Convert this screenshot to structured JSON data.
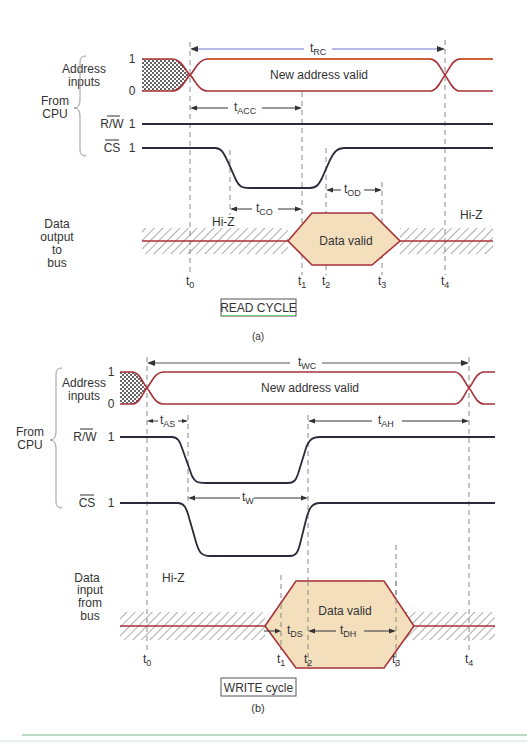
{
  "colors": {
    "signal_red": "#a8323a",
    "signal_orange": "#d0602a",
    "signal_dark": "#2a2a3a",
    "arrow_blue": "#6a6ad0",
    "data_fill": "#f3dfbc",
    "hatch": "#777777",
    "dashed": "#888888",
    "green_rule": "#7fb890"
  },
  "read_cycle": {
    "group_label_line1": "From",
    "group_label_line2": "CPU",
    "signals": {
      "address_line1": "Address",
      "address_line2": "inputs",
      "address_high": "1",
      "address_low": "0",
      "address_valid_text": "New address valid",
      "rw_label": "R/W",
      "rw_level": "1",
      "cs_label": "CS",
      "cs_level": "1",
      "data_line1": "Data",
      "data_line2": "output",
      "data_line3": "to",
      "data_line4": "bus",
      "data_valid_text": "Data valid",
      "hiz_left": "Hi-Z",
      "hiz_right": "Hi-Z"
    },
    "timing_params": {
      "t_RC": {
        "base": "t",
        "sub": "RC"
      },
      "t_ACC": {
        "base": "t",
        "sub": "ACC"
      },
      "t_CO": {
        "base": "t",
        "sub": "CO"
      },
      "t_OD": {
        "base": "t",
        "sub": "OD"
      }
    },
    "time_markers": [
      {
        "base": "t",
        "sub": "0"
      },
      {
        "base": "t",
        "sub": "1"
      },
      {
        "base": "t",
        "sub": "2"
      },
      {
        "base": "t",
        "sub": "3"
      },
      {
        "base": "t",
        "sub": "4"
      }
    ],
    "caption_box": "READ CYCLE",
    "sub_caption": "(a)"
  },
  "write_cycle": {
    "group_label_line1": "From",
    "group_label_line2": "CPU",
    "signals": {
      "address_line1": "Address",
      "address_line2": "inputs",
      "address_high": "1",
      "address_low": "0",
      "address_valid_text": "New address valid",
      "rw_label": "R/W",
      "rw_level": "1",
      "cs_label": "CS",
      "cs_level": "1",
      "data_line1": "Data",
      "data_line2": "input",
      "data_line3": "from",
      "data_line4": "bus",
      "data_valid_text": "Data valid",
      "hiz_left": "Hi-Z"
    },
    "timing_params": {
      "t_WC": {
        "base": "t",
        "sub": "WC"
      },
      "t_AS": {
        "base": "t",
        "sub": "AS"
      },
      "t_AH": {
        "base": "t",
        "sub": "AH"
      },
      "t_W": {
        "base": "t",
        "sub": "W"
      },
      "t_DS": {
        "base": "t",
        "sub": "DS"
      },
      "t_DH": {
        "base": "t",
        "sub": "DH"
      }
    },
    "time_markers": [
      {
        "base": "t",
        "sub": "0"
      },
      {
        "base": "t",
        "sub": "1"
      },
      {
        "base": "t",
        "sub": "2"
      },
      {
        "base": "t",
        "sub": "3"
      },
      {
        "base": "t",
        "sub": "4"
      }
    ],
    "caption_box": "WRITE cycle",
    "sub_caption": "(b)"
  }
}
